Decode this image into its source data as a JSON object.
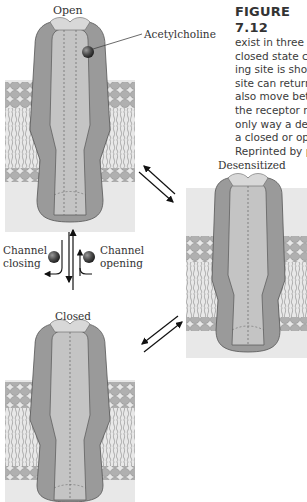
{
  "figure": {
    "title": "FIGURE 7.12",
    "caption_lines": [
      "exist in three di",
      "closed state can",
      "ing site is show",
      "site can return",
      "also move betw",
      "the receptor ne",
      "only way a dese",
      "a closed or ope",
      "Reprinted by pe"
    ]
  },
  "states": {
    "open": {
      "label": "Open"
    },
    "desensitized": {
      "label": "Desensitized"
    },
    "closed": {
      "label": "Closed"
    }
  },
  "annotations": {
    "ligand": "Acetylcholine",
    "channel_closing": [
      "Channel",
      "closing"
    ],
    "channel_opening": [
      "Channel",
      "opening"
    ]
  },
  "colors": {
    "outer_subunit": "#9a9a9a",
    "inner_subunit": "#c4c4c4",
    "cap_light": "#d8d8d8",
    "membrane_bg": "#e8e8e8",
    "lipid_head": "#a8a8a8",
    "ligand": "#555555"
  }
}
